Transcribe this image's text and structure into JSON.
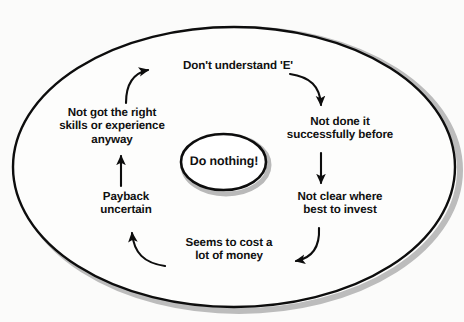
{
  "diagram": {
    "center": {
      "label": "Do nothing!"
    },
    "nodes": [
      {
        "id": "dont-understand",
        "label": "Don't understand 'E'"
      },
      {
        "id": "not-done-it",
        "label": "Not done it\nsuccessfully before"
      },
      {
        "id": "not-clear",
        "label": "Not clear where\nbest to invest"
      },
      {
        "id": "seems-to-cost",
        "label": "Seems to cost a\nlot of money"
      },
      {
        "id": "payback",
        "label": "Payback\nuncertain"
      },
      {
        "id": "not-got-skills",
        "label": "Not got the right\nskills or experience\nanyway"
      }
    ],
    "arrows": [
      {
        "id": "arrow-skills-to-understand",
        "from": "not-got-skills",
        "to": "dont-understand",
        "shape": "curve",
        "direction": "right"
      },
      {
        "id": "arrow-understand-to-done",
        "from": "dont-understand",
        "to": "not-done-it",
        "shape": "curve",
        "direction": "down"
      },
      {
        "id": "arrow-done-to-clear",
        "from": "not-done-it",
        "to": "not-clear",
        "shape": "straight",
        "direction": "down"
      },
      {
        "id": "arrow-clear-to-cost",
        "from": "not-clear",
        "to": "seems-to-cost",
        "shape": "curve",
        "direction": "left"
      },
      {
        "id": "arrow-cost-to-payback",
        "from": "seems-to-cost",
        "to": "payback",
        "shape": "curve",
        "direction": "up"
      },
      {
        "id": "arrow-payback-to-skills",
        "from": "payback",
        "to": "not-got-skills",
        "shape": "straight",
        "direction": "up"
      }
    ],
    "colors": {
      "stroke": "#0d0d0d",
      "text": "#101010",
      "background": "#fbfbfa",
      "shadow": "#b4b4b4",
      "fill": "#ffffff"
    }
  }
}
